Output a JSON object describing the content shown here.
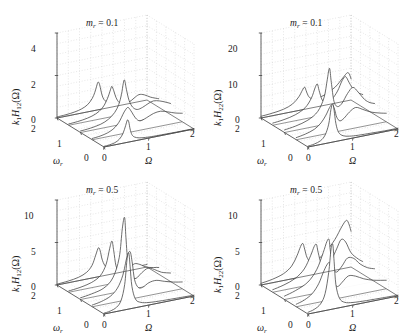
{
  "figure": {
    "layout": "2x2 grid of 3D waterfall plots",
    "panel_order": [
      "top-left",
      "top-right",
      "bottom-left",
      "bottom-right"
    ]
  },
  "panels": [
    {
      "id": "h12-mr01",
      "title_prefix": "m",
      "title_sub": "r",
      "title_eq": " = 0.1",
      "ylabel_pre": "k",
      "ylabel_pre_sub": "1",
      "ylabel_mid": "H",
      "ylabel_mid_sub": "12",
      "ylabel_post": "(Ω)",
      "yticks": [
        "0",
        "2",
        "4"
      ],
      "wticks": [
        "0",
        "1",
        "2"
      ],
      "oticks": [
        "0",
        "1",
        "2"
      ],
      "waxis": "ω",
      "waxis_sub": "r",
      "oaxis": "Ω"
    },
    {
      "id": "h22-mr01",
      "title_prefix": "m",
      "title_sub": "r",
      "title_eq": " = 0.1",
      "ylabel_pre": "k",
      "ylabel_pre_sub": "1",
      "ylabel_mid": "H",
      "ylabel_mid_sub": "22",
      "ylabel_post": "(Ω)",
      "yticks": [
        "0",
        "10",
        "20"
      ],
      "wticks": [
        "0",
        "1",
        "2"
      ],
      "oticks": [
        "0",
        "1",
        "2"
      ],
      "waxis": "ω",
      "waxis_sub": "r",
      "oaxis": "Ω"
    },
    {
      "id": "h12-mr05",
      "title_prefix": "m",
      "title_sub": "r",
      "title_eq": " = 0.5",
      "ylabel_pre": "k",
      "ylabel_pre_sub": "1",
      "ylabel_mid": "H",
      "ylabel_mid_sub": "12",
      "ylabel_post": "(Ω)",
      "yticks": [
        "0",
        "5",
        "10"
      ],
      "wticks": [
        "0",
        "1",
        "2"
      ],
      "oticks": [
        "0",
        "1",
        "2"
      ],
      "waxis": "ω",
      "waxis_sub": "r",
      "oaxis": "Ω"
    },
    {
      "id": "h22-mr05",
      "title_prefix": "m",
      "title_sub": "r",
      "title_eq": " = 0.5",
      "ylabel_pre": "k",
      "ylabel_pre_sub": "1",
      "ylabel_mid": "H",
      "ylabel_mid_sub": "22",
      "ylabel_post": "(Ω)",
      "yticks": [
        "0",
        "5",
        "10"
      ],
      "wticks": [
        "0",
        "1",
        "2"
      ],
      "oticks": [
        "0",
        "1",
        "2"
      ],
      "waxis": "ω",
      "waxis_sub": "r",
      "oaxis": "Ω"
    }
  ],
  "chart_data": [
    {
      "type": "line",
      "id": "h12-mr01",
      "title": "m_r = 0.1",
      "xlabel": "Ω",
      "ylabel": "k_1 H_12(Ω)",
      "zlabel": "ω_r",
      "xlim": [
        0,
        2
      ],
      "ylim": [
        0,
        4
      ],
      "zlim": [
        0,
        2
      ],
      "xticks": [
        0,
        1,
        2
      ],
      "yticks": [
        0,
        2,
        4
      ],
      "zticks": [
        0,
        1,
        2
      ],
      "grid": true,
      "legend": "none",
      "series": [
        {
          "name": "ω_r = 2.0",
          "wr": 2.0,
          "x": [
            0,
            0.2,
            0.4,
            0.55,
            0.68,
            0.78,
            0.84,
            0.88,
            0.91,
            0.94,
            0.97,
            1.0,
            1.04,
            1.1,
            1.2,
            1.35,
            1.55,
            1.75,
            2.0
          ],
          "values": [
            0.05,
            0.07,
            0.12,
            0.2,
            0.34,
            0.58,
            0.85,
            1.12,
            1.3,
            1.22,
            0.95,
            0.66,
            0.44,
            0.3,
            0.2,
            0.14,
            0.1,
            0.08,
            0.06
          ]
        },
        {
          "name": "ω_r = 1.5",
          "wr": 1.5,
          "x": [
            0,
            0.2,
            0.42,
            0.6,
            0.74,
            0.83,
            0.89,
            0.93,
            0.96,
            1.0,
            1.05,
            1.12,
            1.22,
            1.34,
            1.45,
            1.56,
            1.68,
            1.82,
            2.0
          ],
          "values": [
            0.06,
            0.09,
            0.16,
            0.28,
            0.48,
            0.76,
            1.05,
            1.3,
            1.42,
            1.2,
            0.86,
            0.6,
            0.48,
            0.52,
            0.66,
            0.78,
            0.72,
            0.55,
            0.4
          ]
        },
        {
          "name": "ω_r = 1.0",
          "wr": 1.0,
          "x": [
            0,
            0.22,
            0.45,
            0.62,
            0.76,
            0.85,
            0.91,
            0.95,
            0.98,
            1.02,
            1.08,
            1.16,
            1.26,
            1.38,
            1.5,
            1.62,
            1.76,
            1.9,
            2.0
          ],
          "values": [
            0.07,
            0.11,
            0.2,
            0.36,
            0.62,
            0.96,
            1.4,
            1.9,
            2.05,
            1.6,
            1.05,
            0.7,
            0.55,
            0.6,
            0.72,
            0.8,
            0.74,
            0.62,
            0.52
          ]
        },
        {
          "name": "ω_r = 0.5",
          "wr": 0.5,
          "x": [
            0,
            0.18,
            0.34,
            0.46,
            0.55,
            0.62,
            0.68,
            0.74,
            0.8,
            0.88,
            0.96,
            1.06,
            1.2,
            1.36,
            1.52,
            1.68,
            1.84,
            2.0
          ],
          "values": [
            0.06,
            0.1,
            0.18,
            0.3,
            0.46,
            0.66,
            0.9,
            1.1,
            1.18,
            0.92,
            0.62,
            0.44,
            0.52,
            0.66,
            0.7,
            0.6,
            0.48,
            0.4
          ]
        },
        {
          "name": "ω_r = 0.0",
          "wr": 0.0,
          "x": [
            0,
            0.12,
            0.24,
            0.34,
            0.42,
            0.48,
            0.52,
            0.55,
            0.58,
            0.62,
            0.68,
            0.78,
            0.92,
            1.1,
            1.35,
            1.6,
            1.8,
            2.0
          ],
          "values": [
            0.03,
            0.05,
            0.1,
            0.22,
            0.45,
            0.8,
            1.05,
            0.95,
            0.6,
            0.32,
            0.18,
            0.1,
            0.06,
            0.04,
            0.03,
            0.02,
            0.02,
            0.02
          ]
        }
      ]
    },
    {
      "type": "line",
      "id": "h22-mr01",
      "title": "m_r = 0.1",
      "xlabel": "Ω",
      "ylabel": "k_1 H_22(Ω)",
      "zlabel": "ω_r",
      "xlim": [
        0,
        2
      ],
      "ylim": [
        0,
        20
      ],
      "zlim": [
        0,
        2
      ],
      "xticks": [
        0,
        1,
        2
      ],
      "yticks": [
        0,
        10,
        20
      ],
      "zticks": [
        0,
        1,
        2
      ],
      "grid": true,
      "legend": "none",
      "series": [
        {
          "name": "ω_r = 2.0",
          "wr": 2.0,
          "x": [
            0,
            0.25,
            0.5,
            0.7,
            0.84,
            0.92,
            0.97,
            1.0,
            1.05,
            1.12,
            1.25,
            1.45,
            1.65,
            1.82,
            1.92,
            1.97,
            2.0
          ],
          "values": [
            0.4,
            0.6,
            1.0,
            1.8,
            3.2,
            4.6,
            5.2,
            4.4,
            3.0,
            2.2,
            2.0,
            2.6,
            3.8,
            5.6,
            6.6,
            6.0,
            5.0
          ]
        },
        {
          "name": "ω_r = 1.5",
          "wr": 1.5,
          "x": [
            0,
            0.25,
            0.5,
            0.72,
            0.86,
            0.94,
            0.99,
            1.03,
            1.1,
            1.2,
            1.32,
            1.44,
            1.54,
            1.62,
            1.7,
            1.82,
            2.0
          ],
          "values": [
            0.5,
            0.8,
            1.4,
            2.6,
            4.6,
            6.8,
            7.6,
            6.0,
            3.6,
            2.8,
            3.4,
            5.0,
            7.2,
            8.0,
            6.4,
            4.2,
            3.0
          ]
        },
        {
          "name": "ω_r = 1.0",
          "wr": 1.0,
          "x": [
            0,
            0.25,
            0.52,
            0.74,
            0.88,
            0.95,
            1.0,
            1.04,
            1.1,
            1.18,
            1.28,
            1.4,
            1.52,
            1.64,
            1.78,
            1.9,
            2.0
          ],
          "values": [
            0.6,
            1.0,
            1.8,
            3.4,
            6.4,
            10.4,
            13.0,
            9.6,
            5.0,
            3.6,
            4.2,
            6.2,
            7.4,
            6.0,
            4.0,
            3.0,
            2.6
          ]
        },
        {
          "name": "ω_r = 0.5",
          "wr": 0.5,
          "x": [
            0,
            0.2,
            0.4,
            0.55,
            0.66,
            0.74,
            0.8,
            0.85,
            0.9,
            0.97,
            1.06,
            1.18,
            1.32,
            1.48,
            1.66,
            1.84,
            2.0
          ],
          "values": [
            0.5,
            0.9,
            1.6,
            2.8,
            4.4,
            6.0,
            6.6,
            5.4,
            3.4,
            2.4,
            2.8,
            4.0,
            4.8,
            4.0,
            3.0,
            2.4,
            2.0
          ]
        },
        {
          "name": "ω_r = 0.0",
          "wr": 0.0,
          "x": [
            0,
            0.14,
            0.28,
            0.38,
            0.46,
            0.51,
            0.55,
            0.58,
            0.62,
            0.68,
            0.78,
            0.92,
            1.12,
            1.4,
            1.7,
            2.0
          ],
          "values": [
            0.2,
            0.4,
            0.9,
            2.0,
            4.4,
            7.8,
            9.0,
            7.4,
            4.2,
            2.0,
            1.0,
            0.6,
            0.4,
            0.3,
            0.2,
            0.2
          ]
        }
      ]
    },
    {
      "type": "line",
      "id": "h12-mr05",
      "title": "m_r = 0.5",
      "xlabel": "Ω",
      "ylabel": "k_1 H_12(Ω)",
      "zlabel": "ω_r",
      "xlim": [
        0,
        2
      ],
      "ylim": [
        0,
        10
      ],
      "zlim": [
        0,
        2
      ],
      "xticks": [
        0,
        1,
        2
      ],
      "yticks": [
        0,
        5,
        10
      ],
      "zticks": [
        0,
        1,
        2
      ],
      "grid": true,
      "legend": "none",
      "series": [
        {
          "name": "ω_r = 2.0",
          "wr": 2.0,
          "x": [
            0,
            0.25,
            0.48,
            0.66,
            0.78,
            0.86,
            0.92,
            0.96,
            1.0,
            1.06,
            1.14,
            1.26,
            1.42,
            1.6,
            1.8,
            2.0
          ],
          "values": [
            0.1,
            0.2,
            0.4,
            0.8,
            1.5,
            2.6,
            3.4,
            3.0,
            2.0,
            1.2,
            0.8,
            0.6,
            0.5,
            0.4,
            0.3,
            0.3
          ]
        },
        {
          "name": "ω_r = 1.5",
          "wr": 1.5,
          "x": [
            0,
            0.25,
            0.5,
            0.7,
            0.83,
            0.91,
            0.96,
            1.0,
            1.05,
            1.12,
            1.22,
            1.34,
            1.46,
            1.58,
            1.74,
            2.0
          ],
          "values": [
            0.15,
            0.3,
            0.6,
            1.2,
            2.4,
            4.2,
            5.0,
            3.8,
            2.0,
            1.2,
            1.0,
            1.4,
            1.8,
            1.6,
            1.1,
            0.8
          ]
        },
        {
          "name": "ω_r = 1.0",
          "wr": 1.0,
          "x": [
            0,
            0.25,
            0.52,
            0.72,
            0.86,
            0.93,
            0.98,
            1.01,
            1.06,
            1.14,
            1.24,
            1.36,
            1.5,
            1.64,
            1.8,
            2.0
          ],
          "values": [
            0.2,
            0.4,
            0.8,
            1.8,
            4.0,
            7.4,
            8.6,
            6.2,
            2.8,
            1.4,
            1.2,
            1.7,
            2.1,
            1.8,
            1.3,
            1.0
          ]
        },
        {
          "name": "ω_r = 0.5",
          "wr": 0.5,
          "x": [
            0,
            0.2,
            0.4,
            0.56,
            0.68,
            0.77,
            0.84,
            0.89,
            0.94,
            1.02,
            1.12,
            1.26,
            1.42,
            1.6,
            1.8,
            2.0
          ],
          "values": [
            0.2,
            0.4,
            0.8,
            1.6,
            3.0,
            5.0,
            5.6,
            4.2,
            2.2,
            1.2,
            1.1,
            1.5,
            1.6,
            1.3,
            1.0,
            0.8
          ]
        },
        {
          "name": "ω_r = 0.0",
          "wr": 0.0,
          "x": [
            0,
            0.14,
            0.28,
            0.38,
            0.46,
            0.51,
            0.55,
            0.58,
            0.62,
            0.7,
            0.82,
            1.0,
            1.3,
            1.65,
            2.0
          ],
          "values": [
            0.1,
            0.2,
            0.5,
            1.2,
            3.0,
            5.8,
            6.6,
            5.0,
            2.6,
            1.0,
            0.5,
            0.3,
            0.2,
            0.15,
            0.1
          ]
        }
      ]
    },
    {
      "type": "line",
      "id": "h22-mr05",
      "title": "m_r = 0.5",
      "xlabel": "Ω",
      "ylabel": "k_1 H_22(Ω)",
      "zlabel": "ω_r",
      "xlim": [
        0,
        2
      ],
      "ylim": [
        0,
        10
      ],
      "zlim": [
        0,
        2
      ],
      "xticks": [
        0,
        1,
        2
      ],
      "yticks": [
        0,
        5,
        10
      ],
      "zticks": [
        0,
        1,
        2
      ],
      "grid": true,
      "legend": "none",
      "series": [
        {
          "name": "ω_r = 2.0",
          "wr": 2.0,
          "x": [
            0,
            0.25,
            0.5,
            0.68,
            0.8,
            0.88,
            0.93,
            0.97,
            1.02,
            1.1,
            1.24,
            1.44,
            1.64,
            1.8,
            1.9,
            1.96,
            2.0
          ],
          "values": [
            0.2,
            0.4,
            0.8,
            1.5,
            2.6,
            3.6,
            3.9,
            3.2,
            2.2,
            1.6,
            1.6,
            2.4,
            3.6,
            5.0,
            5.6,
            5.0,
            4.2
          ]
        },
        {
          "name": "ω_r = 1.5",
          "wr": 1.5,
          "x": [
            0,
            0.25,
            0.5,
            0.7,
            0.84,
            0.92,
            0.97,
            1.01,
            1.08,
            1.18,
            1.3,
            1.42,
            1.52,
            1.62,
            1.74,
            1.9,
            2.0
          ],
          "values": [
            0.3,
            0.6,
            1.1,
            2.0,
            3.4,
            4.4,
            4.6,
            3.6,
            2.2,
            1.8,
            2.4,
            3.6,
            4.6,
            4.2,
            2.8,
            1.9,
            1.5
          ]
        },
        {
          "name": "ω_r = 1.0",
          "wr": 1.0,
          "x": [
            0,
            0.25,
            0.52,
            0.72,
            0.86,
            0.94,
            0.99,
            1.02,
            1.08,
            1.16,
            1.28,
            1.4,
            1.54,
            1.68,
            1.84,
            2.0
          ],
          "values": [
            0.4,
            0.8,
            1.5,
            2.8,
            4.6,
            5.8,
            6.0,
            4.6,
            2.6,
            2.0,
            2.6,
            3.4,
            3.2,
            2.4,
            1.8,
            1.5
          ]
        },
        {
          "name": "ω_r = 0.5",
          "wr": 0.5,
          "x": [
            0,
            0.18,
            0.36,
            0.5,
            0.6,
            0.68,
            0.74,
            0.79,
            0.84,
            0.92,
            1.02,
            1.16,
            1.32,
            1.5,
            1.72,
            2.0
          ],
          "values": [
            0.3,
            0.6,
            1.2,
            2.2,
            3.4,
            4.2,
            4.4,
            3.4,
            2.0,
            1.4,
            1.8,
            2.4,
            2.2,
            1.7,
            1.3,
            1.0
          ]
        },
        {
          "name": "ω_r = 0.0",
          "wr": 0.0,
          "x": [
            0,
            0.14,
            0.28,
            0.38,
            0.46,
            0.51,
            0.55,
            0.58,
            0.62,
            0.7,
            0.82,
            1.0,
            1.3,
            1.65,
            2.0
          ],
          "values": [
            0.2,
            0.4,
            0.9,
            2.0,
            4.4,
            7.0,
            7.6,
            5.6,
            2.8,
            1.1,
            0.5,
            0.3,
            0.2,
            0.15,
            0.1
          ]
        }
      ]
    }
  ]
}
